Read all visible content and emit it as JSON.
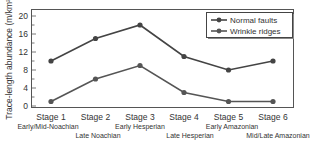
{
  "chart_data": {
    "type": "line",
    "title": "",
    "xlabel": "",
    "ylabel": "Trace-length abundance (m/km²)",
    "ylim": [
      0,
      20
    ],
    "yticks": [
      0,
      4,
      8,
      12,
      16,
      20
    ],
    "grid": false,
    "legend_position": "upper right",
    "categories": [
      "Stage 1",
      "Stage 2",
      "Stage 3",
      "Stage 4",
      "Stage 5",
      "Stage 6"
    ],
    "periods": [
      "Early/Mid-Noachian",
      "Late Noachian",
      "Early Hesperian",
      "Late Hesperian",
      "Early Amazonian",
      "Mid/Late Amazonian"
    ],
    "series": [
      {
        "name": "Normal faults",
        "values": [
          10,
          15,
          18,
          11,
          8,
          10
        ],
        "color": "#444444"
      },
      {
        "name": "Wrinkle ridges",
        "values": [
          1,
          6,
          9,
          3,
          1,
          1
        ],
        "color": "#555555"
      }
    ]
  }
}
